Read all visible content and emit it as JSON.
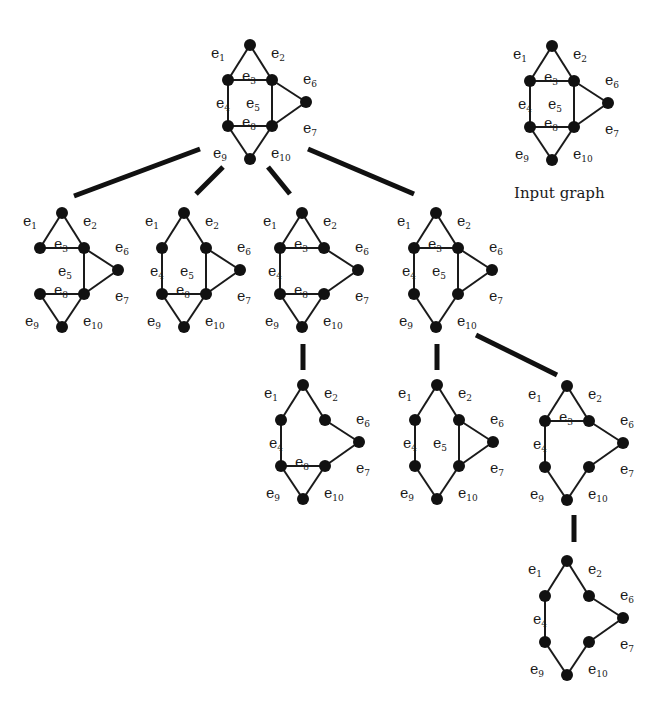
{
  "caption": {
    "text": "Input graph",
    "x": 514,
    "y": 184
  },
  "node_radius": 6,
  "label_offsets": {
    "e1": [
      -28,
      -10
    ],
    "e2": [
      10,
      -10
    ],
    "e3": [
      -8,
      -4
    ],
    "e4": [
      -12,
      0
    ],
    "e5": [
      -26,
      0
    ],
    "e6": [
      14,
      -12
    ],
    "e7": [
      14,
      14
    ],
    "e8": [
      -8,
      -4
    ],
    "e9": [
      -26,
      10
    ],
    "e10": [
      10,
      10
    ]
  },
  "graphs": [
    {
      "id": "root",
      "origin": [
        228,
        45
      ],
      "edges": [
        "e1",
        "e2",
        "e3",
        "e4",
        "e5",
        "e6",
        "e7",
        "e8",
        "e9",
        "e10"
      ]
    },
    {
      "id": "input",
      "origin": [
        530,
        46
      ],
      "edges": [
        "e1",
        "e2",
        "e3",
        "e4",
        "e5",
        "e6",
        "e7",
        "e8",
        "e9",
        "e10"
      ]
    },
    {
      "id": "minus-e4",
      "origin": [
        40,
        213
      ],
      "edges": [
        "e1",
        "e2",
        "e3",
        "e5",
        "e6",
        "e7",
        "e8",
        "e9",
        "e10"
      ]
    },
    {
      "id": "minus-e3",
      "origin": [
        162,
        213
      ],
      "edges": [
        "e1",
        "e2",
        "e4",
        "e5",
        "e6",
        "e7",
        "e8",
        "e9",
        "e10"
      ]
    },
    {
      "id": "minus-e5",
      "origin": [
        280,
        213
      ],
      "edges": [
        "e1",
        "e2",
        "e3",
        "e4",
        "e6",
        "e7",
        "e8",
        "e9",
        "e10"
      ]
    },
    {
      "id": "minus-e8",
      "origin": [
        414,
        213
      ],
      "edges": [
        "e1",
        "e2",
        "e3",
        "e4",
        "e5",
        "e6",
        "e7",
        "e9",
        "e10"
      ]
    },
    {
      "id": "minus-e3-e5",
      "origin": [
        281,
        385
      ],
      "edges": [
        "e1",
        "e2",
        "e4",
        "e6",
        "e7",
        "e8",
        "e9",
        "e10"
      ]
    },
    {
      "id": "minus-e3-e8",
      "origin": [
        415,
        385
      ],
      "edges": [
        "e1",
        "e2",
        "e4",
        "e5",
        "e6",
        "e7",
        "e9",
        "e10"
      ]
    },
    {
      "id": "minus-e5-e8",
      "origin": [
        545,
        386
      ],
      "edges": [
        "e1",
        "e2",
        "e3",
        "e4",
        "e6",
        "e7",
        "e9",
        "e10"
      ]
    },
    {
      "id": "minus-e3-e5-e8",
      "origin": [
        545,
        561
      ],
      "edges": [
        "e1",
        "e2",
        "e4",
        "e6",
        "e7",
        "e9",
        "e10"
      ]
    }
  ],
  "connectors": [
    [
      74,
      196,
      200,
      149
    ],
    [
      196,
      194,
      223,
      167
    ],
    [
      268,
      167,
      290,
      194
    ],
    [
      308,
      149,
      414,
      194
    ],
    [
      303,
      344,
      303,
      370
    ],
    [
      437,
      344,
      437,
      370
    ],
    [
      476,
      335,
      557,
      375
    ],
    [
      574,
      515,
      574,
      542
    ]
  ]
}
